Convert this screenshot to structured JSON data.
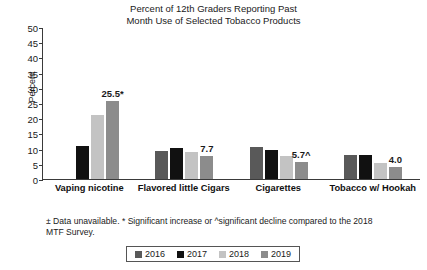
{
  "title": {
    "line1": "Percent of 12th Graders Reporting Past",
    "line2": "Month Use of Selected Tobacco Products"
  },
  "axes": {
    "ylabel": "Percent",
    "yticks": [
      "50",
      "45",
      "40",
      "35",
      "30",
      "25",
      "20",
      "15",
      "10",
      "5",
      "0"
    ]
  },
  "footnote": {
    "line1": "± Data unavailable. * Significant increase or ^significant decline compared",
    "line2": "to the 2018 MTF Survey."
  },
  "legend": {
    "items": [
      {
        "label": "2016",
        "color": "#595959"
      },
      {
        "label": "2017",
        "color": "#111111"
      },
      {
        "label": "2018",
        "color": "#c3c3c3"
      },
      {
        "label": "2019",
        "color": "#8c8c8c"
      }
    ]
  },
  "chart_data": {
    "type": "bar",
    "title": "Percent of 12th Graders Reporting Past Month Use of Selected Tobacco Products",
    "xlabel": "",
    "ylabel": "Percent",
    "ylim": [
      0,
      50
    ],
    "ytick_step": 5,
    "grid": false,
    "legend_position": "bottom",
    "categories": [
      "Vaping nicotine",
      "Flavored little Cigars",
      "Cigarettes",
      "Tobacco w/ Hookah"
    ],
    "series": [
      {
        "name": "2016",
        "color": "#595959",
        "values": [
          null,
          9.3,
          10.5,
          8.0
        ]
      },
      {
        "name": "2017",
        "color": "#111111",
        "values": [
          11.0,
          10.1,
          9.7,
          7.8
        ]
      },
      {
        "name": "2018",
        "color": "#c3c3c3",
        "values": [
          20.9,
          8.8,
          7.6,
          5.3
        ]
      },
      {
        "name": "2019",
        "color": "#8c8c8c",
        "values": [
          25.5,
          7.7,
          5.7,
          4.0
        ]
      }
    ],
    "data_labels": [
      {
        "category": "Vaping nicotine",
        "series": "2019",
        "text": "25.5*"
      },
      {
        "category": "Flavored little Cigars",
        "series": "2019",
        "text": "7.7"
      },
      {
        "category": "Cigarettes",
        "series": "2019",
        "text": "5.7^"
      },
      {
        "category": "Tobacco w/ Hookah",
        "series": "2019",
        "text": "4.0"
      }
    ],
    "annotations": [
      "± Data unavailable.",
      "* Significant increase or ^significant decline compared to the 2018 MTF Survey."
    ]
  }
}
